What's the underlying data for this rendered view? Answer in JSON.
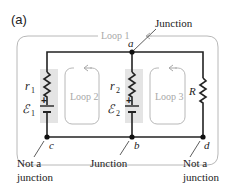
{
  "figure": {
    "panel_label": "(a)",
    "colors": {
      "wire": "#222222",
      "loop_outline": "#b8b8b8",
      "loop_text": "#a8a8a8",
      "shade": "#e4e4e4",
      "text": "#222222"
    }
  },
  "loops": {
    "loop1": "Loop 1",
    "loop2": "Loop 2",
    "loop3": "Loop 3"
  },
  "components": {
    "r1_label": "r",
    "r1_sub": "1",
    "emf1_label": "ℰ",
    "emf1_sub": "1",
    "r2_label": "r",
    "r2_sub": "2",
    "emf2_label": "ℰ",
    "emf2_sub": "2",
    "R_label": "R",
    "plus": "+"
  },
  "nodes": {
    "a": "a",
    "b": "b",
    "c": "c",
    "d": "d"
  },
  "annotations": {
    "junction_top": "Junction",
    "junction_bottom": "Junction",
    "not_junction_left_1": "Not a",
    "not_junction_left_2": "junction",
    "not_junction_right_1": "Not a",
    "not_junction_right_2": "junction"
  }
}
